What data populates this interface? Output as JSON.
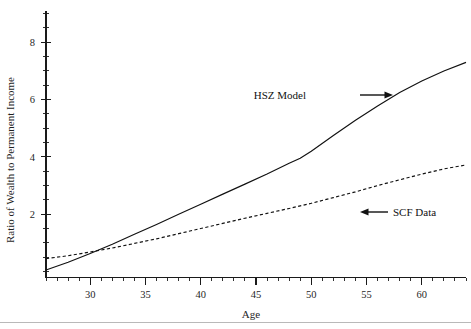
{
  "chart_data": {
    "type": "line",
    "title": "",
    "xlabel": "Age",
    "ylabel": "Ratio of Wealth to Permanent Income",
    "xlim": [
      26,
      64
    ],
    "ylim": [
      0,
      9.1
    ],
    "grid": false,
    "legend_position": "inline-annotations",
    "x_ticks_major": [
      30,
      35,
      40,
      45,
      50,
      55,
      60
    ],
    "x_tick_labels": [
      "30",
      "35",
      "40",
      "45",
      "50",
      "55",
      "60"
    ],
    "x_ticks_minor_step": 1,
    "y_ticks_major": [
      2,
      4,
      6,
      8
    ],
    "y_tick_labels": [
      "2",
      "4",
      "6",
      "8"
    ],
    "y_ticks_minor_step": 0.5,
    "series": [
      {
        "name": "HSZ Model",
        "style": "solid",
        "color": "#111111",
        "x": [
          26,
          28,
          30,
          32,
          34,
          36,
          38,
          40,
          42,
          44,
          46,
          48,
          49,
          50,
          52,
          54,
          56,
          58,
          60,
          62,
          64
        ],
        "values": [
          0.05,
          0.32,
          0.63,
          0.95,
          1.3,
          1.64,
          2.0,
          2.35,
          2.7,
          3.05,
          3.4,
          3.78,
          3.95,
          4.2,
          4.75,
          5.28,
          5.78,
          6.25,
          6.65,
          7.0,
          7.3
        ]
      },
      {
        "name": "SCF Data",
        "style": "dashed",
        "color": "#111111",
        "x": [
          26,
          28,
          30,
          32,
          34,
          36,
          38,
          40,
          42,
          44,
          46,
          48,
          50,
          52,
          54,
          56,
          58,
          60,
          62,
          64
        ],
        "values": [
          0.45,
          0.55,
          0.68,
          0.82,
          0.98,
          1.14,
          1.32,
          1.5,
          1.68,
          1.86,
          2.03,
          2.2,
          2.38,
          2.58,
          2.78,
          3.0,
          3.2,
          3.4,
          3.58,
          3.72
        ]
      }
    ],
    "annotations": [
      {
        "name": "hsz-model-annotation",
        "text": "HSZ Model",
        "label_x": 306,
        "label_y": 99,
        "arrow_direction": "right",
        "arrow_from_x": 360,
        "arrow_to_x": 393,
        "arrow_y": 95
      },
      {
        "name": "scf-data-annotation",
        "text": "SCF Data",
        "label_x": 393,
        "label_y": 216,
        "arrow_direction": "left",
        "arrow_from_x": 388,
        "arrow_to_x": 360,
        "arrow_y": 212
      }
    ]
  }
}
